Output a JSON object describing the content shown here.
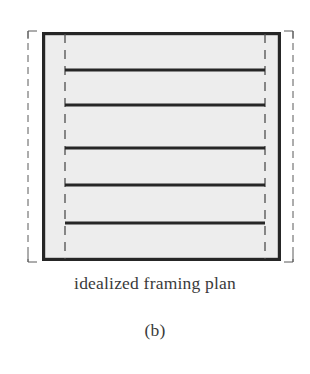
{
  "figure": {
    "caption": "idealized framing plan",
    "subfigure_label": "(b)",
    "type": "structural-framing-plan-diagram"
  },
  "colors": {
    "page_background": "#ffffff",
    "slab_fill": "#ededed",
    "wall_stroke": "#262626",
    "beam_stroke": "#262626",
    "dashed_stroke": "#5a5a5a",
    "text": "#3a3a3a"
  },
  "diagram": {
    "outer_dashed_boundary": {
      "name": "tributary-boundary",
      "x1": 28,
      "y1": 31,
      "x2": 293,
      "y2": 262,
      "stroke_width": 1,
      "dash_pattern": "7,5"
    },
    "building_outline": {
      "name": "bearing-wall-outline",
      "x1": 42,
      "y1": 32,
      "x2": 281,
      "y2": 261,
      "stroke_width": 3.2,
      "fill": "#ededed"
    },
    "interior_dashed_lines": [
      {
        "name": "left-support-line",
        "x": 65,
        "y1": 33,
        "y2": 260
      },
      {
        "name": "right-support-line",
        "x": 265,
        "y1": 33,
        "y2": 260
      }
    ],
    "beams": [
      {
        "index": 1,
        "y": 70,
        "x1": 65,
        "x2": 265
      },
      {
        "index": 2,
        "y": 105,
        "x1": 65,
        "x2": 265
      },
      {
        "index": 3,
        "y": 148,
        "x1": 65,
        "x2": 265
      },
      {
        "index": 4,
        "y": 185,
        "x1": 65,
        "x2": 265
      },
      {
        "index": 5,
        "y": 223,
        "x1": 65,
        "x2": 265
      }
    ],
    "beam_stroke_width": 3.0,
    "beam_count": 5,
    "corner_ticks": [
      {
        "name": "tick-top-left",
        "x": 28,
        "y": 31,
        "dx": 9,
        "dy": 8
      },
      {
        "name": "tick-top-right",
        "x": 293,
        "y": 31,
        "dx": -9,
        "dy": 8
      },
      {
        "name": "tick-bottom-left",
        "x": 28,
        "y": 262,
        "dx": 9,
        "dy": -8
      },
      {
        "name": "tick-bottom-right",
        "x": 293,
        "y": 262,
        "dx": -9,
        "dy": -8
      }
    ]
  }
}
